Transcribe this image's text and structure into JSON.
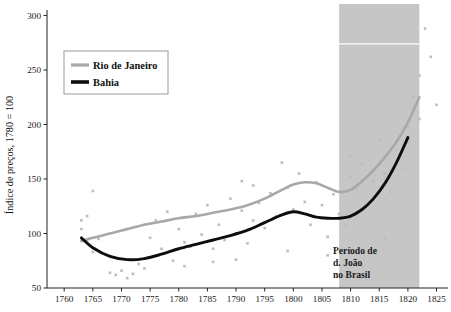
{
  "chart_data": {
    "type": "scatter",
    "title": "",
    "subtitle": "",
    "xlabel": "",
    "ylabel": "Índice de preços, 1780 = 100",
    "xlim": [
      1757,
      1827
    ],
    "ylim": [
      50,
      305
    ],
    "grid": false,
    "legend_position": "top-left",
    "x_ticks": [
      1760,
      1765,
      1770,
      1775,
      1780,
      1785,
      1790,
      1795,
      1800,
      1805,
      1810,
      1815,
      1820,
      1825
    ],
    "x_tick_labels": [
      "1760",
      "1765",
      "1770",
      "1775",
      "1780",
      "1785",
      "1790",
      "1795",
      "1800",
      "1805",
      "1810",
      "1815",
      "1820",
      "1825"
    ],
    "y_ticks": [
      50,
      100,
      150,
      200,
      250,
      300
    ],
    "y_tick_labels": [
      "50",
      "100",
      "150",
      "200",
      "250",
      "300"
    ],
    "series": [
      {
        "name": "Rio de Janeiro",
        "kind": "trend-line",
        "color": "#a8a8a8",
        "x": [
          1763,
          1765,
          1768,
          1771,
          1774,
          1777,
          1780,
          1783,
          1786,
          1789,
          1792,
          1795,
          1798,
          1800,
          1802,
          1804,
          1806,
          1808,
          1810,
          1812,
          1814,
          1816,
          1818,
          1820,
          1822
        ],
        "values": [
          93,
          96,
          100,
          104,
          108,
          111,
          114,
          116,
          119,
          122,
          126,
          132,
          140,
          145,
          147,
          146,
          142,
          138,
          140,
          148,
          158,
          170,
          184,
          202,
          225
        ]
      },
      {
        "name": "Bahia",
        "kind": "trend-line",
        "color": "#0d0d0d",
        "x": [
          1763,
          1765,
          1768,
          1771,
          1774,
          1777,
          1780,
          1783,
          1786,
          1789,
          1792,
          1795,
          1798,
          1800,
          1802,
          1804,
          1806,
          1808,
          1810,
          1812,
          1814,
          1816,
          1818,
          1820
        ],
        "values": [
          96,
          87,
          79,
          76,
          77,
          81,
          86,
          90,
          94,
          98,
          103,
          110,
          117,
          120,
          118,
          115,
          114,
          114,
          116,
          122,
          132,
          146,
          165,
          188
        ]
      },
      {
        "name": "observations",
        "kind": "scatter",
        "color": "#bdbdbd",
        "points": [
          [
            1763,
            112
          ],
          [
            1763,
            104
          ],
          [
            1764,
            116
          ],
          [
            1764,
            93
          ],
          [
            1765,
            139
          ],
          [
            1765,
            83
          ],
          [
            1766,
            95
          ],
          [
            1768,
            64
          ],
          [
            1769,
            62
          ],
          [
            1770,
            66
          ],
          [
            1771,
            59
          ],
          [
            1772,
            63
          ],
          [
            1773,
            72
          ],
          [
            1774,
            68
          ],
          [
            1775,
            96
          ],
          [
            1776,
            112
          ],
          [
            1777,
            86
          ],
          [
            1778,
            120
          ],
          [
            1779,
            75
          ],
          [
            1780,
            104
          ],
          [
            1781,
            92
          ],
          [
            1782,
            88
          ],
          [
            1783,
            118
          ],
          [
            1784,
            99
          ],
          [
            1785,
            126
          ],
          [
            1786,
            86
          ],
          [
            1787,
            108
          ],
          [
            1788,
            94
          ],
          [
            1789,
            132
          ],
          [
            1790,
            100
          ],
          [
            1791,
            148
          ],
          [
            1791,
            121
          ],
          [
            1792,
            91
          ],
          [
            1793,
            144
          ],
          [
            1793,
            112
          ],
          [
            1794,
            128
          ],
          [
            1795,
            105
          ],
          [
            1796,
            137
          ],
          [
            1797,
            116
          ],
          [
            1798,
            165
          ],
          [
            1799,
            142
          ],
          [
            1800,
            122
          ],
          [
            1801,
            155
          ],
          [
            1802,
            129
          ],
          [
            1803,
            108
          ],
          [
            1804,
            147
          ],
          [
            1805,
            126
          ],
          [
            1806,
            97
          ],
          [
            1807,
            136
          ],
          [
            1808,
            118
          ],
          [
            1809,
            108
          ],
          [
            1810,
            171
          ],
          [
            1810,
            152
          ],
          [
            1811,
            141
          ],
          [
            1812,
            163
          ],
          [
            1813,
            128
          ],
          [
            1814,
            148
          ],
          [
            1815,
            186
          ],
          [
            1816,
            155
          ],
          [
            1817,
            138
          ],
          [
            1818,
            176
          ],
          [
            1819,
            160
          ],
          [
            1820,
            198
          ],
          [
            1820,
            184
          ],
          [
            1821,
            225
          ],
          [
            1822,
            245
          ],
          [
            1822,
            205
          ],
          [
            1823,
            288
          ],
          [
            1824,
            262
          ],
          [
            1825,
            218
          ],
          [
            1809,
            61
          ],
          [
            1812,
            70
          ],
          [
            1816,
            96
          ],
          [
            1806,
            80
          ],
          [
            1799,
            84
          ],
          [
            1786,
            74
          ],
          [
            1781,
            70
          ],
          [
            1790,
            76
          ]
        ]
      }
    ],
    "shaded_region": {
      "label": "Período de d. João no Brasil",
      "label_lines": [
        "Período de",
        "d. João",
        "no Brasil"
      ],
      "x_start": 1808,
      "x_end": 1822,
      "color": "#c6c6c6"
    }
  },
  "legend": {
    "items": [
      {
        "label": "Rio de Janeiro",
        "color": "#a8a8a8"
      },
      {
        "label": "Bahia",
        "color": "#0d0d0d"
      }
    ]
  },
  "annotation": {
    "line1": "Período de",
    "line2": "d. João",
    "line3": "no Brasil"
  },
  "axes": {
    "y_title": "Índice de preços, 1780 = 100",
    "y_labels": [
      "300",
      "250",
      "200",
      "150",
      "100",
      "50"
    ],
    "x_labels": [
      "1760",
      "1765",
      "1770",
      "1775",
      "1780",
      "1785",
      "1790",
      "1795",
      "1800",
      "1805",
      "1810",
      "1815",
      "1820",
      "1825"
    ]
  }
}
